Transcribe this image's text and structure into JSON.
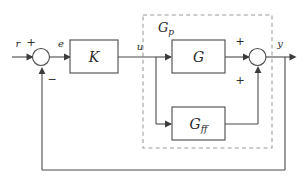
{
  "diagram": {
    "colors": {
      "stroke": "#4a4a4a",
      "dashed_stroke": "#9a9a9a",
      "text": "#2b2b2b",
      "background": "#ffffff",
      "arrowhead": "#3c3c3c"
    },
    "blocks": [
      {
        "id": "controller",
        "label": "K",
        "label_base": "K",
        "label_sub": ""
      },
      {
        "id": "plant",
        "label": "G",
        "label_base": "G",
        "label_sub": ""
      },
      {
        "id": "feedforward",
        "label": "Gff",
        "label_base": "G",
        "label_sub": "ff"
      }
    ],
    "group": {
      "id": "plant-group",
      "label": "Gp",
      "label_base": "G",
      "label_sub": "p",
      "style": "dashed"
    },
    "signals": [
      {
        "id": "reference",
        "label": "r"
      },
      {
        "id": "error",
        "label": "e"
      },
      {
        "id": "control",
        "label": "u"
      },
      {
        "id": "output",
        "label": "y"
      }
    ],
    "summing_junctions": [
      {
        "id": "error-summer",
        "inputs": [
          {
            "from": "reference",
            "sign": "+"
          },
          {
            "from": "output-feedback",
            "sign": "−"
          }
        ],
        "output": "error"
      },
      {
        "id": "output-summer",
        "inputs": [
          {
            "from": "plant",
            "sign": "+"
          },
          {
            "from": "feedforward",
            "sign": "+"
          }
        ],
        "output": "output"
      }
    ],
    "signs": {
      "plus": "+",
      "minus": "−"
    }
  }
}
